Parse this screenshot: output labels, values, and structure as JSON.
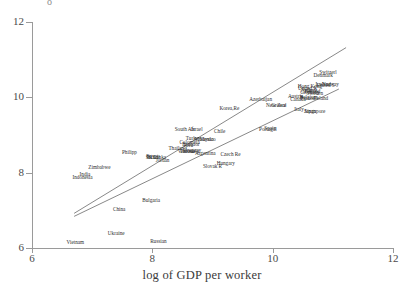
{
  "chart_data": {
    "type": "scatter",
    "title": "",
    "xlabel": "log of GDP per worker",
    "ylabel": "",
    "xlim": [
      6,
      12
    ],
    "ylim": [
      6,
      12
    ],
    "xticks": [
      6,
      8,
      10,
      12
    ],
    "yticks": [
      6,
      8,
      10,
      12
    ],
    "grid": false,
    "legend": null,
    "point_label_field": "country",
    "points": [
      {
        "country": "Vietnam",
        "x": 6.72,
        "y": 6.12
      },
      {
        "country": "Ukraine",
        "x": 7.4,
        "y": 6.37
      },
      {
        "country": "Russian",
        "x": 8.1,
        "y": 6.17
      },
      {
        "country": "China",
        "x": 7.45,
        "y": 7.02
      },
      {
        "country": "Bulgaria",
        "x": 7.98,
        "y": 7.25
      },
      {
        "country": "India",
        "x": 6.88,
        "y": 7.94
      },
      {
        "country": "Indonesia",
        "x": 6.84,
        "y": 7.85
      },
      {
        "country": "Zimbabwe",
        "x": 7.12,
        "y": 8.12
      },
      {
        "country": "Philipp",
        "x": 7.62,
        "y": 8.52
      },
      {
        "country": "Brazil",
        "x": 8.02,
        "y": 8.4
      },
      {
        "country": "Egypt",
        "x": 8.0,
        "y": 8.41
      },
      {
        "country": "Sri Lanka",
        "x": 8.06,
        "y": 8.4
      },
      {
        "country": "Jordan",
        "x": 8.17,
        "y": 8.32
      },
      {
        "country": "Thailand",
        "x": 8.42,
        "y": 8.62
      },
      {
        "country": "Peru",
        "x": 8.6,
        "y": 8.72
      },
      {
        "country": "Colombia",
        "x": 8.62,
        "y": 8.78
      },
      {
        "country": "Ecuador",
        "x": 8.64,
        "y": 8.74
      },
      {
        "country": "Uruguay",
        "x": 8.66,
        "y": 8.58
      },
      {
        "country": "Venezuela",
        "x": 8.6,
        "y": 8.56
      },
      {
        "country": "Tunisia",
        "x": 8.58,
        "y": 8.54
      },
      {
        "country": "Argentina",
        "x": 8.88,
        "y": 8.5
      },
      {
        "country": "Turkey",
        "x": 8.68,
        "y": 8.9
      },
      {
        "country": "Mexico",
        "x": 8.92,
        "y": 8.88
      },
      {
        "country": "Malaysia",
        "x": 8.86,
        "y": 8.86
      },
      {
        "country": "South Afr",
        "x": 8.54,
        "y": 9.12
      },
      {
        "country": "Israel",
        "x": 8.74,
        "y": 9.12
      },
      {
        "country": "Chile",
        "x": 9.12,
        "y": 9.08
      },
      {
        "country": "Czech Re",
        "x": 9.3,
        "y": 8.46
      },
      {
        "country": "Hungary",
        "x": 9.22,
        "y": 8.22
      },
      {
        "country": "Slovak R",
        "x": 9.0,
        "y": 8.14
      },
      {
        "country": "Korea,Re",
        "x": 9.28,
        "y": 9.68
      },
      {
        "country": "Portugal",
        "x": 9.92,
        "y": 9.14
      },
      {
        "country": "Spain",
        "x": 9.96,
        "y": 9.16
      },
      {
        "country": "Azerbaijan",
        "x": 9.8,
        "y": 9.92
      },
      {
        "country": "New Zeal",
        "x": 10.06,
        "y": 9.78
      },
      {
        "country": "Greece",
        "x": 10.1,
        "y": 9.76
      },
      {
        "country": "Italy",
        "x": 10.44,
        "y": 9.66
      },
      {
        "country": "Japan",
        "x": 10.62,
        "y": 9.62
      },
      {
        "country": "Singapore",
        "x": 10.7,
        "y": 9.62
      },
      {
        "country": "Austria",
        "x": 10.38,
        "y": 10.02
      },
      {
        "country": "Canada",
        "x": 10.42,
        "y": 9.94
      },
      {
        "country": "Belgium",
        "x": 10.6,
        "y": 9.98
      },
      {
        "country": "France",
        "x": 10.58,
        "y": 9.96
      },
      {
        "country": "Ireland",
        "x": 10.8,
        "y": 9.96
      },
      {
        "country": "Germany",
        "x": 10.62,
        "y": 10.12
      },
      {
        "country": "Netherl",
        "x": 10.6,
        "y": 10.16
      },
      {
        "country": "Finland",
        "x": 10.66,
        "y": 10.14
      },
      {
        "country": "Sweden",
        "x": 10.7,
        "y": 10.1
      },
      {
        "country": "United K",
        "x": 10.58,
        "y": 10.22
      },
      {
        "country": "United S",
        "x": 10.88,
        "y": 10.3
      },
      {
        "country": "Hong Kong",
        "x": 10.62,
        "y": 10.28
      },
      {
        "country": "Norway",
        "x": 10.96,
        "y": 10.34
      },
      {
        "country": "Iceland",
        "x": 10.84,
        "y": 10.32
      },
      {
        "country": "Denmark",
        "x": 10.84,
        "y": 10.56
      },
      {
        "country": "Switzerl",
        "x": 10.92,
        "y": 10.64
      }
    ],
    "fit_lines": [
      {
        "name": "upper-fit-line",
        "x0": 6.7,
        "y0": 6.92,
        "x1": 11.22,
        "y1": 11.32
      },
      {
        "name": "lower-fit-line",
        "x0": 6.7,
        "y0": 6.84,
        "x1": 11.1,
        "y1": 10.22
      }
    ]
  },
  "axes": {
    "x_title": "log of GDP per worker",
    "y_title": "",
    "x_tick_labels": [
      "6",
      "8",
      "10",
      "12"
    ],
    "y_tick_labels": [
      "6",
      "8",
      "10",
      "12"
    ]
  },
  "colors": {
    "background": "#ffffff",
    "axis": "#9a9a9a",
    "tick_text": "#4a4a4a",
    "label_text": "#2b2b2b",
    "fit_line": "#555555"
  }
}
